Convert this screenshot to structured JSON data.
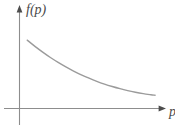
{
  "figure": {
    "background_color": "#ffffff",
    "axis_color": "#8d8d8d",
    "curve_color": "#9b9b9b",
    "label_color": "#4a4a4a",
    "y_axis_label": "f(p)",
    "x_axis_label": "p",
    "y_axis_label_name": "f-of-p",
    "x_axis_label_name": "p"
  },
  "chart_data": {
    "type": "line",
    "title": "",
    "subtitle": "",
    "xlabel": "p",
    "ylabel": "f(p)",
    "grid": false,
    "legend": null,
    "axis_arrows": {
      "x": true,
      "y": true
    },
    "tick_labels": {
      "x": [],
      "y": []
    },
    "xlim": [
      0,
      1
    ],
    "ylim": [
      0,
      1
    ],
    "annotations": [],
    "series": [
      {
        "name": "f(p)",
        "description": "smooth convex decreasing curve",
        "color": "#9b9b9b",
        "x": [
          0.055,
          0.11,
          0.165,
          0.22,
          0.275,
          0.33,
          0.385,
          0.44,
          0.495,
          0.55,
          0.605,
          0.66,
          0.715,
          0.77,
          0.825,
          0.88,
          0.935,
          0.965
        ],
        "y": [
          0.79,
          0.718,
          0.652,
          0.59,
          0.533,
          0.481,
          0.433,
          0.389,
          0.35,
          0.314,
          0.282,
          0.254,
          0.229,
          0.207,
          0.188,
          0.172,
          0.159,
          0.153
        ]
      }
    ]
  }
}
